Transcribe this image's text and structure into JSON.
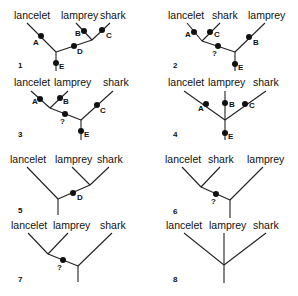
{
  "figure": {
    "title": "",
    "taxa": [
      "lancelet",
      "lamprey",
      "shark"
    ]
  },
  "trees": [
    {
      "number": "1",
      "labels": [
        "lancelet",
        "lamprey",
        "shark"
      ],
      "characters": [
        "A",
        "B",
        "C",
        "D",
        "E"
      ]
    },
    {
      "number": "2",
      "labels": [
        "lancelet",
        "shark",
        "lamprey"
      ],
      "characters": [
        "A",
        "C",
        "B",
        "?",
        "E"
      ]
    },
    {
      "number": "3",
      "labels": [
        "lancelet",
        "lamprey",
        "shark"
      ],
      "characters": [
        "A",
        "B",
        "C",
        "?",
        "E"
      ]
    },
    {
      "number": "4",
      "labels": [
        "lancelet",
        "lamprey",
        "shark"
      ],
      "characters": [
        "A",
        "B",
        "C",
        "E"
      ]
    },
    {
      "number": "5",
      "labels": [
        "lancelet",
        "lamprey",
        "shark"
      ],
      "characters": [
        "D"
      ]
    },
    {
      "number": "6",
      "labels": [
        "lancelet",
        "shark",
        "lamprey"
      ],
      "characters": [
        "?"
      ]
    },
    {
      "number": "7",
      "labels": [
        "lancelet",
        "lamprey",
        "shark"
      ],
      "characters": [
        "?"
      ]
    },
    {
      "number": "8",
      "labels": [
        "lancelet",
        "lamprey",
        "shark"
      ],
      "characters": []
    }
  ]
}
